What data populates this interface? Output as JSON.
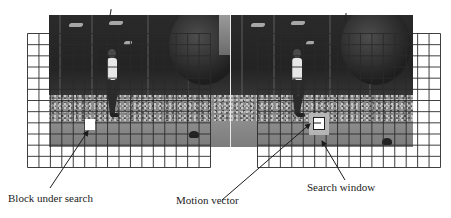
{
  "figure": {
    "type": "block-matching motion estimation diagram",
    "frames": [
      {
        "id": "reference-frame",
        "description": "previous video frame with macroblock grid overlay"
      },
      {
        "id": "current-frame",
        "description": "current video frame with macroblock grid overlay"
      }
    ],
    "grid": {
      "columns": 16,
      "rows": 12,
      "cell_px": 11.4,
      "line_color": "#2a2a2a"
    },
    "colors": {
      "grid_line": "#2a2a2a",
      "block_fill": "#ffffff",
      "search_window_fill": "#b8b8b8",
      "arrow": "#1a1a1a",
      "text": "#222222"
    }
  },
  "labels": {
    "block_under_search": "Block under search",
    "motion_vector": "Motion vector",
    "search_window": "Search window"
  }
}
